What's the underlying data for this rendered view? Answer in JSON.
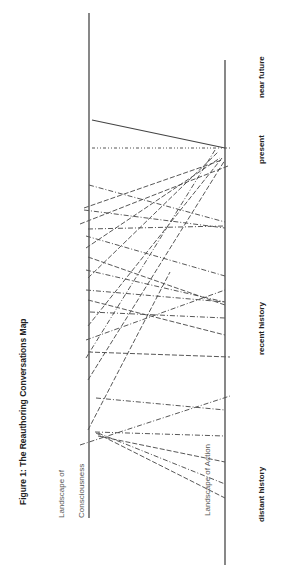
{
  "figure": {
    "title": "Figure 1: The Reauthoring Conversations Map",
    "orientation": "rotated 90 degrees counter-clockwise"
  },
  "axes": {
    "consciousness": {
      "label_line1": "Landscape of",
      "label_line2": "Consciousness",
      "x": 89,
      "y_top": 13,
      "y_bottom": 518
    },
    "action": {
      "label": "Landscape of Action",
      "x": 225,
      "y_top": 60,
      "y_bottom": 565
    }
  },
  "time_labels": {
    "near_future": "near future",
    "present": "present",
    "recent_history": "recent history",
    "distant_history": "distant history"
  },
  "colors": {
    "axis": "#555555",
    "line": "#444444",
    "text": "#222222",
    "label_light": "#555555"
  },
  "lines": [
    {
      "style": "solid",
      "x1": 92,
      "y1": 120,
      "x2": 225,
      "y2": 148
    },
    {
      "style": "dashdotdot",
      "x1": 92,
      "y1": 148,
      "x2": 232,
      "y2": 148
    },
    {
      "style": "dashdot",
      "x1": 89,
      "y1": 185,
      "x2": 225,
      "y2": 222
    },
    {
      "style": "dash",
      "x1": 84,
      "y1": 208,
      "x2": 222,
      "y2": 160
    },
    {
      "style": "dashdot",
      "x1": 84,
      "y1": 210,
      "x2": 225,
      "y2": 228
    },
    {
      "style": "dash",
      "x1": 80,
      "y1": 224,
      "x2": 228,
      "y2": 166
    },
    {
      "style": "dashdot",
      "x1": 88,
      "y1": 229,
      "x2": 225,
      "y2": 226
    },
    {
      "style": "dash",
      "x1": 86,
      "y1": 248,
      "x2": 220,
      "y2": 158
    },
    {
      "style": "dashdot",
      "x1": 86,
      "y1": 236,
      "x2": 225,
      "y2": 276
    },
    {
      "style": "dash",
      "x1": 88,
      "y1": 257,
      "x2": 225,
      "y2": 305
    },
    {
      "style": "dashdot",
      "x1": 86,
      "y1": 270,
      "x2": 225,
      "y2": 302
    },
    {
      "style": "dash",
      "x1": 88,
      "y1": 278,
      "x2": 218,
      "y2": 152
    },
    {
      "style": "dashdot",
      "x1": 86,
      "y1": 290,
      "x2": 225,
      "y2": 302
    },
    {
      "style": "dash",
      "x1": 88,
      "y1": 300,
      "x2": 225,
      "y2": 335
    },
    {
      "style": "dashdot",
      "x1": 90,
      "y1": 312,
      "x2": 225,
      "y2": 318
    },
    {
      "style": "dash",
      "x1": 88,
      "y1": 326,
      "x2": 222,
      "y2": 158
    },
    {
      "style": "dashdot",
      "x1": 86,
      "y1": 340,
      "x2": 225,
      "y2": 290
    },
    {
      "style": "dash",
      "x1": 88,
      "y1": 352,
      "x2": 230,
      "y2": 357
    },
    {
      "style": "dashdot",
      "x1": 86,
      "y1": 358,
      "x2": 215,
      "y2": 150
    },
    {
      "style": "dash",
      "x1": 88,
      "y1": 380,
      "x2": 225,
      "y2": 160
    },
    {
      "style": "dashdot",
      "x1": 96,
      "y1": 398,
      "x2": 225,
      "y2": 410
    },
    {
      "style": "dash",
      "x1": 88,
      "y1": 430,
      "x2": 170,
      "y2": 272
    },
    {
      "style": "dashdot",
      "x1": 95,
      "y1": 432,
      "x2": 225,
      "y2": 436
    },
    {
      "style": "dash",
      "x1": 98,
      "y1": 436,
      "x2": 225,
      "y2": 462
    },
    {
      "style": "dashdot",
      "x1": 80,
      "y1": 445,
      "x2": 230,
      "y2": 396
    },
    {
      "style": "dashdot",
      "x1": 98,
      "y1": 433,
      "x2": 225,
      "y2": 484
    },
    {
      "style": "dash",
      "x1": 96,
      "y1": 433,
      "x2": 225,
      "y2": 498
    }
  ]
}
